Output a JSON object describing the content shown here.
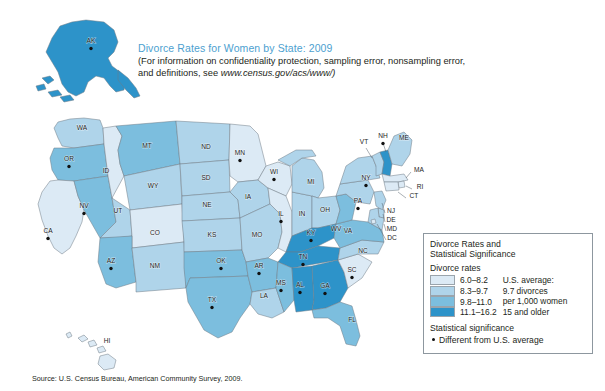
{
  "title": {
    "heading": "Divorce Rates for Women by State: 2009",
    "note_line1": "(For information on confidentiality protection, sampling error, nonsampling error,",
    "note_line2_prefix": "and definitions, see ",
    "note_url": "www.census.gov/acs/www/)"
  },
  "source": "Source: U.S. Census Bureau, American Community Survey, 2009.",
  "legend": {
    "title_line1": "Divorce Rates and",
    "title_line2": "Statistical Significance",
    "rates_heading": "Divorce rates",
    "bins": [
      {
        "label": "6.0–8.2",
        "color": "#dceaf5"
      },
      {
        "label": "8.3–9.7",
        "color": "#afd4ea"
      },
      {
        "label": "9.8–11.0",
        "color": "#7cbede"
      },
      {
        "label": "11.1–16.2",
        "color": "#2d93c9"
      }
    ],
    "average_lines": [
      "U.S. average:",
      "9.7 divorces",
      "per 1,000 women",
      "15 and older"
    ],
    "significance_heading": "Statistical significance",
    "significance_item": "Different from U.S. average"
  },
  "chart_data": {
    "type": "choropleth",
    "title": "Divorce Rates for Women by State: 2009",
    "unit": "divorces per 1,000 women 15 and older",
    "us_average": 9.7,
    "bins": [
      "6.0-8.2",
      "8.3-9.7",
      "9.8-11.0",
      "11.1-16.2"
    ],
    "bin_colors": [
      "#dceaf5",
      "#afd4ea",
      "#7cbede",
      "#2d93c9"
    ],
    "states": [
      {
        "code": "AK",
        "bin": 4,
        "significant": true,
        "lx": 91,
        "ly": 43
      },
      {
        "code": "HI",
        "bin": 1,
        "significant": false,
        "lx": 107,
        "ly": 343
      },
      {
        "code": "WA",
        "bin": 2,
        "significant": false,
        "lx": 82,
        "ly": 130
      },
      {
        "code": "OR",
        "bin": 3,
        "significant": true,
        "lx": 69,
        "ly": 161
      },
      {
        "code": "CA",
        "bin": 1,
        "significant": true,
        "lx": 48,
        "ly": 233
      },
      {
        "code": "NV",
        "bin": 3,
        "significant": true,
        "lx": 84,
        "ly": 208
      },
      {
        "code": "ID",
        "bin": 1,
        "significant": false,
        "lx": 106,
        "ly": 173
      },
      {
        "code": "MT",
        "bin": 3,
        "significant": false,
        "lx": 147,
        "ly": 148
      },
      {
        "code": "WY",
        "bin": 2,
        "significant": false,
        "lx": 153,
        "ly": 188
      },
      {
        "code": "UT",
        "bin": 2,
        "significant": false,
        "lx": 118,
        "ly": 213
      },
      {
        "code": "CO",
        "bin": 1,
        "significant": false,
        "lx": 155,
        "ly": 235
      },
      {
        "code": "AZ",
        "bin": 3,
        "significant": true,
        "lx": 111,
        "ly": 263
      },
      {
        "code": "NM",
        "bin": 2,
        "significant": false,
        "lx": 155,
        "ly": 268
      },
      {
        "code": "ND",
        "bin": 2,
        "significant": false,
        "lx": 206,
        "ly": 149
      },
      {
        "code": "SD",
        "bin": 2,
        "significant": false,
        "lx": 206,
        "ly": 180
      },
      {
        "code": "NE",
        "bin": 2,
        "significant": false,
        "lx": 207,
        "ly": 207
      },
      {
        "code": "KS",
        "bin": 2,
        "significant": false,
        "lx": 212,
        "ly": 237
      },
      {
        "code": "OK",
        "bin": 3,
        "significant": true,
        "lx": 221,
        "ly": 263
      },
      {
        "code": "TX",
        "bin": 3,
        "significant": true,
        "lx": 212,
        "ly": 302
      },
      {
        "code": "MN",
        "bin": 1,
        "significant": true,
        "lx": 240,
        "ly": 155
      },
      {
        "code": "IA",
        "bin": 2,
        "significant": false,
        "lx": 248,
        "ly": 199
      },
      {
        "code": "MO",
        "bin": 2,
        "significant": false,
        "lx": 257,
        "ly": 237
      },
      {
        "code": "AR",
        "bin": 3,
        "significant": true,
        "lx": 259,
        "ly": 268
      },
      {
        "code": "LA",
        "bin": 2,
        "significant": false,
        "lx": 264,
        "ly": 298
      },
      {
        "code": "MS",
        "bin": 3,
        "significant": true,
        "lx": 281,
        "ly": 285
      },
      {
        "code": "AL",
        "bin": 4,
        "significant": true,
        "lx": 300,
        "ly": 287
      },
      {
        "code": "GA",
        "bin": 4,
        "significant": true,
        "lx": 325,
        "ly": 288
      },
      {
        "code": "FL",
        "bin": 3,
        "significant": false,
        "lx": 352,
        "ly": 322
      },
      {
        "code": "SC",
        "bin": 1,
        "significant": true,
        "lx": 352,
        "ly": 272
      },
      {
        "code": "NC",
        "bin": 2,
        "significant": false,
        "lx": 363,
        "ly": 253
      },
      {
        "code": "TN",
        "bin": 4,
        "significant": true,
        "lx": 303,
        "ly": 259
      },
      {
        "code": "KY",
        "bin": 4,
        "significant": true,
        "lx": 311,
        "ly": 235
      },
      {
        "code": "WI",
        "bin": 1,
        "significant": true,
        "lx": 274,
        "ly": 174
      },
      {
        "code": "IL",
        "bin": 1,
        "significant": true,
        "lx": 281,
        "ly": 216
      },
      {
        "code": "IN",
        "bin": 2,
        "significant": false,
        "lx": 302,
        "ly": 216
      },
      {
        "code": "MI",
        "bin": 2,
        "significant": false,
        "lx": 311,
        "ly": 184
      },
      {
        "code": "OH",
        "bin": 2,
        "significant": false,
        "lx": 325,
        "ly": 212
      },
      {
        "code": "WV",
        "bin": 3,
        "significant": false,
        "lx": 336,
        "ly": 231
      },
      {
        "code": "VA",
        "bin": 3,
        "significant": false,
        "lx": 348,
        "ly": 233
      },
      {
        "code": "PA",
        "bin": 2,
        "significant": true,
        "lx": 358,
        "ly": 203
      },
      {
        "code": "NY",
        "bin": 2,
        "significant": true,
        "lx": 366,
        "ly": 180
      },
      {
        "code": "VT",
        "bin": 2,
        "significant": false,
        "lx": 364,
        "ly": 144
      },
      {
        "code": "NH",
        "bin": 4,
        "significant": true,
        "lx": 383,
        "ly": 138
      },
      {
        "code": "ME",
        "bin": 2,
        "significant": false,
        "lx": 404,
        "ly": 140
      },
      {
        "code": "MA",
        "bin": 1,
        "significant": false,
        "lx": 419,
        "ly": 172
      },
      {
        "code": "RI",
        "bin": 1,
        "significant": false,
        "lx": 420,
        "ly": 189
      },
      {
        "code": "CT",
        "bin": 1,
        "significant": false,
        "lx": 414,
        "ly": 198
      },
      {
        "code": "NJ",
        "bin": 2,
        "significant": false,
        "lx": 391,
        "ly": 213
      },
      {
        "code": "DE",
        "bin": 2,
        "significant": false,
        "lx": 391,
        "ly": 222
      },
      {
        "code": "MD",
        "bin": 2,
        "significant": false,
        "lx": 392,
        "ly": 231
      },
      {
        "code": "DC",
        "bin": 1,
        "significant": false,
        "lx": 392,
        "ly": 240
      }
    ]
  }
}
